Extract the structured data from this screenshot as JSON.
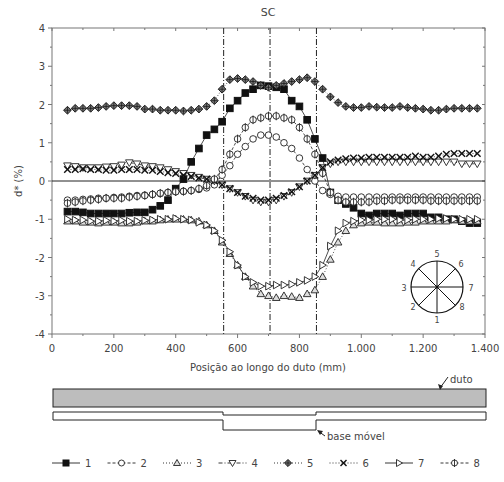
{
  "chart_data": {
    "type": "line",
    "title": "SC",
    "xlabel": "Posição ao longo do duto (mm)",
    "ylabel": "d* (%)",
    "xlim": [
      0,
      1400
    ],
    "ylim": [
      -4,
      4
    ],
    "x_ticks": [
      0,
      200,
      400,
      600,
      800,
      1000,
      1200,
      1400
    ],
    "x_tick_labels": [
      "0",
      "200",
      "400",
      "600",
      "800",
      "1.000",
      "1.200",
      "1.400"
    ],
    "y_ticks": [
      -4,
      -3,
      -2,
      -1,
      0,
      1,
      2,
      3,
      4
    ],
    "y_tick_labels": [
      "-4",
      "-3",
      "-2",
      "-1",
      "0",
      "1",
      "2",
      "3",
      "4"
    ],
    "grid": false,
    "reference_lines": {
      "horizontal_zero": 0,
      "vertical_dashdot": [
        555,
        705,
        855
      ]
    },
    "x": [
      50,
      75,
      100,
      125,
      150,
      175,
      200,
      225,
      250,
      275,
      300,
      325,
      350,
      375,
      400,
      425,
      450,
      475,
      500,
      525,
      550,
      575,
      600,
      625,
      650,
      675,
      700,
      725,
      750,
      775,
      800,
      825,
      850,
      875,
      900,
      925,
      950,
      975,
      1000,
      1025,
      1050,
      1075,
      1100,
      1125,
      1150,
      1175,
      1200,
      1225,
      1250,
      1275,
      1300,
      1325,
      1350,
      1375
    ],
    "series": [
      {
        "name": "1",
        "marker": "filled-square",
        "line": "solid",
        "values": [
          -0.8,
          -0.8,
          -0.82,
          -0.85,
          -0.85,
          -0.85,
          -0.85,
          -0.85,
          -0.83,
          -0.82,
          -0.82,
          -0.75,
          -0.65,
          -0.5,
          -0.2,
          0.05,
          0.5,
          0.85,
          1.2,
          1.35,
          1.55,
          1.9,
          2.1,
          2.3,
          2.4,
          2.5,
          2.48,
          2.45,
          2.4,
          2.1,
          1.95,
          1.6,
          1.1,
          0.6,
          -0.3,
          -0.5,
          -0.6,
          -0.7,
          -0.85,
          -0.9,
          -0.85,
          -0.85,
          -0.85,
          -0.9,
          -0.85,
          -0.85,
          -0.85,
          -0.95,
          -0.95,
          -1.0,
          -1.0,
          -1.05,
          -1.1,
          -1.1
        ]
      },
      {
        "name": "2",
        "marker": "open-circle",
        "line": "dashed",
        "values": [
          -0.5,
          -0.5,
          -0.48,
          -0.47,
          -0.45,
          -0.45,
          -0.43,
          -0.42,
          -0.4,
          -0.38,
          -0.37,
          -0.35,
          -0.33,
          -0.3,
          -0.28,
          -0.27,
          -0.25,
          -0.22,
          -0.18,
          -0.1,
          0.15,
          0.4,
          0.7,
          0.9,
          1.1,
          1.2,
          1.2,
          1.15,
          1.0,
          0.85,
          0.6,
          0.3,
          0.0,
          -0.25,
          -0.35,
          -0.4,
          -0.42,
          -0.42,
          -0.42,
          -0.42,
          -0.42,
          -0.42,
          -0.42,
          -0.42,
          -0.42,
          -0.42,
          -0.42,
          -0.42,
          -0.42,
          -0.42,
          -0.42,
          -0.42,
          -0.42,
          -0.42
        ]
      },
      {
        "name": "3",
        "marker": "open-triangle-up",
        "line": "dotted",
        "values": [
          -1.05,
          -1.05,
          -1.08,
          -1.08,
          -1.1,
          -1.08,
          -1.08,
          -1.1,
          -1.1,
          -1.08,
          -1.05,
          -1.05,
          -1.02,
          -1.0,
          -1.0,
          -1.0,
          -1.02,
          -1.05,
          -1.15,
          -1.3,
          -1.6,
          -1.9,
          -2.2,
          -2.5,
          -2.75,
          -2.95,
          -3.0,
          -3.05,
          -3.0,
          -3.02,
          -3.05,
          -2.95,
          -2.85,
          -2.5,
          -2.05,
          -1.6,
          -1.3,
          -1.15,
          -1.1,
          -1.08,
          -1.08,
          -1.1,
          -1.1,
          -1.1,
          -1.08,
          -1.08,
          -1.05,
          -1.05,
          -1.05,
          -1.05,
          -1.02,
          -1.05,
          -1.05,
          -1.05
        ]
      },
      {
        "name": "4",
        "marker": "open-triangle-down",
        "line": "dash-dot",
        "values": [
          0.4,
          0.38,
          0.35,
          0.35,
          0.35,
          0.37,
          0.38,
          0.42,
          0.48,
          0.45,
          0.4,
          0.38,
          0.35,
          0.3,
          0.25,
          0.2,
          0.15,
          0.1,
          0.05,
          0.0,
          -0.1,
          -0.2,
          -0.3,
          -0.4,
          -0.5,
          -0.55,
          -0.55,
          -0.5,
          -0.4,
          -0.3,
          -0.15,
          0.0,
          0.15,
          0.35,
          0.45,
          0.5,
          0.5,
          0.5,
          0.5,
          0.5,
          0.5,
          0.5,
          0.5,
          0.5,
          0.5,
          0.5,
          0.5,
          0.5,
          0.5,
          0.5,
          0.5,
          0.45,
          0.45,
          0.45
        ]
      },
      {
        "name": "5",
        "marker": "filled-diamond-cross",
        "line": "dotted",
        "values": [
          1.85,
          1.9,
          1.9,
          1.9,
          1.92,
          1.95,
          1.97,
          1.97,
          1.97,
          1.95,
          1.88,
          1.88,
          1.85,
          1.85,
          1.85,
          1.83,
          1.85,
          1.88,
          1.95,
          2.1,
          2.4,
          2.65,
          2.68,
          2.65,
          2.6,
          2.5,
          2.45,
          2.5,
          2.55,
          2.6,
          2.65,
          2.7,
          2.6,
          2.4,
          2.2,
          2.05,
          1.95,
          1.92,
          1.92,
          1.95,
          1.93,
          1.92,
          1.92,
          1.95,
          1.92,
          1.9,
          1.88,
          1.85,
          1.85,
          1.88,
          1.9,
          1.9,
          1.9,
          1.9
        ]
      },
      {
        "name": "6",
        "marker": "x-cross",
        "line": "dotted",
        "values": [
          0.3,
          0.3,
          0.32,
          0.3,
          0.3,
          0.28,
          0.28,
          0.3,
          0.3,
          0.3,
          0.28,
          0.28,
          0.25,
          0.22,
          0.2,
          0.15,
          0.12,
          0.08,
          0.05,
          0.0,
          -0.1,
          -0.2,
          -0.3,
          -0.4,
          -0.45,
          -0.5,
          -0.5,
          -0.45,
          -0.38,
          -0.28,
          -0.15,
          0.0,
          0.15,
          0.35,
          0.5,
          0.55,
          0.58,
          0.6,
          0.6,
          0.62,
          0.62,
          0.62,
          0.62,
          0.62,
          0.62,
          0.65,
          0.62,
          0.62,
          0.65,
          0.7,
          0.72,
          0.72,
          0.72,
          0.72
        ]
      },
      {
        "name": "7",
        "marker": "open-triangle-right",
        "line": "solid",
        "values": [
          -1.0,
          -1.02,
          -1.02,
          -1.05,
          -1.05,
          -1.03,
          -1.05,
          -1.03,
          -1.05,
          -1.05,
          -1.03,
          -1.02,
          -1.0,
          -1.0,
          -0.98,
          -1.0,
          -1.02,
          -1.08,
          -1.15,
          -1.3,
          -1.55,
          -1.85,
          -2.2,
          -2.5,
          -2.65,
          -2.75,
          -2.75,
          -2.72,
          -2.72,
          -2.7,
          -2.65,
          -2.6,
          -2.5,
          -2.2,
          -1.7,
          -1.3,
          -1.1,
          -1.05,
          -1.02,
          -1.02,
          -1.0,
          -1.0,
          -1.0,
          -1.02,
          -1.02,
          -1.0,
          -1.0,
          -1.0,
          -0.98,
          -0.98,
          -1.0,
          -1.0,
          -1.0,
          -1.0
        ]
      },
      {
        "name": "8",
        "marker": "circle-vbar",
        "line": "dashed",
        "values": [
          -0.58,
          -0.55,
          -0.52,
          -0.5,
          -0.48,
          -0.45,
          -0.45,
          -0.45,
          -0.42,
          -0.4,
          -0.38,
          -0.35,
          -0.32,
          -0.3,
          -0.28,
          -0.27,
          -0.25,
          -0.2,
          -0.12,
          0.05,
          0.3,
          0.7,
          1.1,
          1.4,
          1.6,
          1.65,
          1.7,
          1.7,
          1.65,
          1.6,
          1.4,
          1.1,
          0.7,
          0.2,
          -0.3,
          -0.5,
          -0.55,
          -0.55,
          -0.55,
          -0.55,
          -0.52,
          -0.52,
          -0.5,
          -0.5,
          -0.5,
          -0.5,
          -0.5,
          -0.52,
          -0.52,
          -0.52,
          -0.52,
          -0.52,
          -0.52,
          -0.52
        ]
      }
    ],
    "legend": {
      "position": "bottom",
      "entries": [
        "1",
        "2",
        "3",
        "4",
        "5",
        "6",
        "7",
        "8"
      ]
    },
    "inset_diagram": {
      "type": "pipe-cross-section",
      "labels": [
        "1",
        "2",
        "3",
        "4",
        "5",
        "6",
        "7",
        "8"
      ]
    },
    "schematic": {
      "duto_label": "duto",
      "base_label": "base móvel"
    }
  },
  "labels": {
    "title": "SC",
    "xlabel": "Posição ao longo do duto (mm)",
    "ylabel": "d* (%)",
    "duto": "duto",
    "base": "base móvel"
  }
}
